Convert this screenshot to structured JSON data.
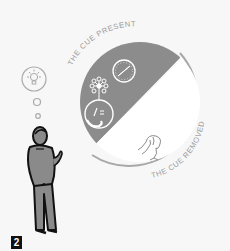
{
  "figure": {
    "number": "2",
    "labels": {
      "cue_present": "THE CUE PRESENT",
      "cue_removed": "THE CUE REMOVED"
    },
    "colors": {
      "background": "#f7f7f7",
      "present_half": "#8c8c8c",
      "removed_half": "#ffffff",
      "ring": "#a8a8a8",
      "label_text": "#9a9a9a",
      "person_fill": "#8a8a8a",
      "outline": "#111111"
    },
    "icons": [
      "lightbulb-thought-icon",
      "compass-icon",
      "network-flower-icon",
      "face-with-hand-icon",
      "forgetful-figure-icon",
      "person-thinking-icon"
    ]
  }
}
